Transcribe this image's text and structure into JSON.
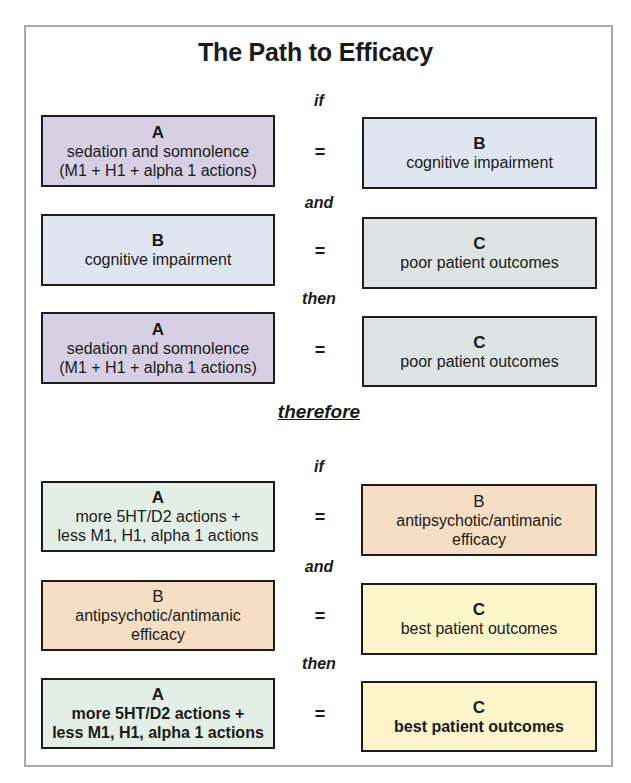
{
  "title": "The Path to Efficacy",
  "connectors": {
    "if1": "if",
    "and1": "and",
    "then1": "then",
    "therefore": "therefore",
    "if2": "if",
    "and2": "and",
    "then2": "then"
  },
  "equals": "=",
  "rows": [
    {
      "left": {
        "letter": "A",
        "lines": [
          "sedation and somnolence",
          "(M1 + H1 + alpha 1 actions)"
        ],
        "color": "#d7d0e4"
      },
      "right": {
        "letter": "B",
        "lines": [
          "cognitive impairment"
        ],
        "color": "#dfe6f2"
      }
    },
    {
      "left": {
        "letter": "B",
        "lines": [
          "cognitive impairment"
        ],
        "color": "#dfe6f2"
      },
      "right": {
        "letter": "C",
        "lines": [
          "poor patient outcomes"
        ],
        "color": "#dde4e3"
      }
    },
    {
      "left": {
        "letter": "A",
        "lines": [
          "sedation and somnolence",
          "(M1 + H1 + alpha 1 actions)"
        ],
        "color": "#d7d0e4"
      },
      "right": {
        "letter": "C",
        "lines": [
          "poor patient outcomes"
        ],
        "color": "#dde4e3"
      }
    },
    {
      "left": {
        "letter": "A",
        "lines": [
          "more 5HT/D2 actions +",
          "less M1, H1, alpha 1 actions"
        ],
        "color": "#e3efe6"
      },
      "right": {
        "letter": "B",
        "lines": [
          "antipsychotic/antimanic",
          "efficacy"
        ],
        "color": "#f5dec3"
      }
    },
    {
      "left": {
        "letter": "B",
        "lines": [
          "antipsychotic/antimanic",
          "efficacy"
        ],
        "color": "#f5dec3"
      },
      "right": {
        "letter": "C",
        "lines": [
          "best patient outcomes"
        ],
        "color": "#fcf4cb"
      }
    },
    {
      "left": {
        "letter": "A",
        "lines": [
          "more 5HT/D2 actions +",
          "less M1, H1, alpha 1 actions"
        ],
        "color": "#e3efe6"
      },
      "right": {
        "letter": "C",
        "lines": [
          "best patient outcomes"
        ],
        "color": "#fcf4cb"
      }
    }
  ]
}
